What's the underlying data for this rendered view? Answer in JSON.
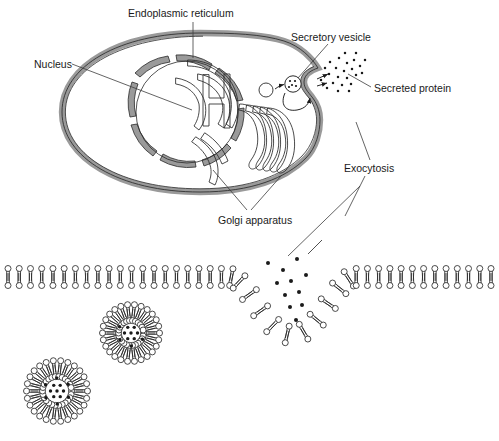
{
  "figure": {
    "background_color": "#ffffff",
    "line_color": "#1a1a1a",
    "membrane_fill": "#9a9a9a",
    "leader_color": "#3c3c3c"
  },
  "labels": {
    "nucleus": "Nucleus",
    "endoplasmic_reticulum": "Endoplasmic reticulum",
    "secretory_vesicle": "Secretory vesicle",
    "secreted_protein": "Secreted protein",
    "exocytosis": "Exocytosis",
    "golgi_apparatus": "Golgi apparatus"
  },
  "cell": {
    "organelles": [
      "plasma-membrane",
      "nuclear-envelope",
      "endoplasmic-reticulum",
      "golgi-apparatus",
      "transport-vesicle",
      "secretory-vesicle",
      "fusion-pore"
    ],
    "golgi_cisternae_count": 5,
    "secreted_particle_count": 24
  },
  "magnified_view": {
    "structure": "phospholipid-bilayer",
    "leaflets": 2,
    "lipids_upper_leaflet": 44,
    "lipids_lower_leaflet": 44,
    "fusion_pore_present": true,
    "escaping_particle_count": 11,
    "free_vesicles": [
      {
        "name": "vesicle-left",
        "cx": 57,
        "cy": 391,
        "radius": 28,
        "lipid_count": 26,
        "cargo_dots": 13
      },
      {
        "name": "vesicle-middle",
        "cx": 131,
        "cy": 333,
        "radius": 26,
        "lipid_count": 26,
        "cargo_dots": 11
      }
    ]
  }
}
